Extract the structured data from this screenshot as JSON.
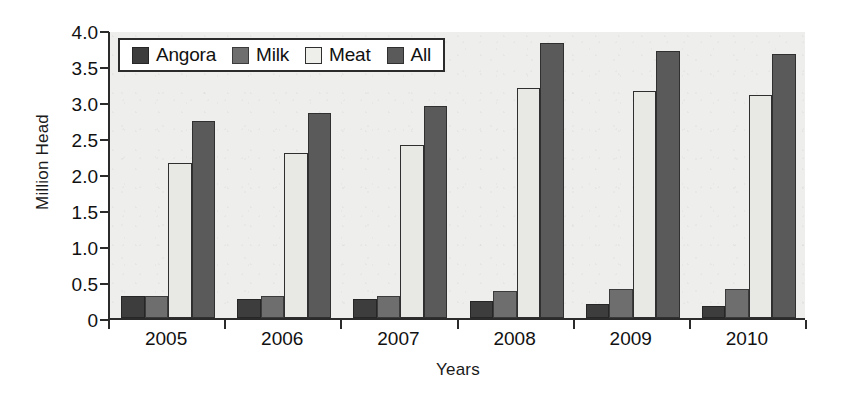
{
  "chart_data": {
    "type": "bar",
    "title": "",
    "xlabel": "Years",
    "ylabel": "Million Head",
    "categories": [
      "2005",
      "2006",
      "2007",
      "2008",
      "2009",
      "2010"
    ],
    "series": [
      {
        "name": "Angora",
        "color": "#3d3d3d",
        "values": [
          0.3,
          0.27,
          0.26,
          0.23,
          0.19,
          0.17
        ]
      },
      {
        "name": "Milk",
        "color": "#6e6e6e",
        "values": [
          0.3,
          0.31,
          0.31,
          0.38,
          0.4,
          0.4
        ]
      },
      {
        "name": "Meat",
        "color": "#e8e8e4",
        "values": [
          2.15,
          2.29,
          2.4,
          3.2,
          3.15,
          3.1
        ]
      },
      {
        "name": "All",
        "color": "#5a5a5a",
        "values": [
          2.74,
          2.85,
          2.94,
          3.82,
          3.71,
          3.67
        ]
      }
    ],
    "ylim": [
      0,
      4.0
    ],
    "yticks": [
      "0",
      "0.5",
      "1.0",
      "1.5",
      "2.0",
      "2.5",
      "3.0",
      "3.5",
      "4.0"
    ],
    "ytick_values": [
      0,
      0.5,
      1.0,
      1.5,
      2.0,
      2.5,
      3.0,
      3.5,
      4.0
    ],
    "grid": false,
    "legend_position": "top-left",
    "legend": [
      "Angora",
      "Milk",
      "Meat",
      "All"
    ],
    "plot_background": "#eeeeec",
    "axis_color": "#2b2b2b"
  }
}
